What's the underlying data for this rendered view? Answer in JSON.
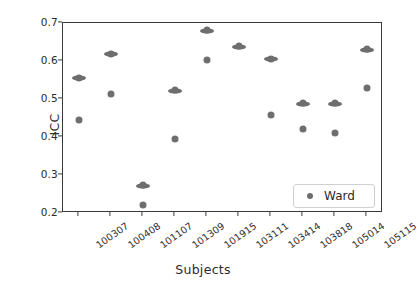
{
  "chart_data": {
    "type": "scatter",
    "title": "",
    "xlabel": "Subjects",
    "ylabel": "ICC",
    "categories": [
      "100307",
      "100408",
      "101107",
      "101309",
      "101915",
      "103111",
      "103414",
      "103818",
      "105014",
      "105115"
    ],
    "yticks": [
      0.2,
      0.3,
      0.4,
      0.5,
      0.6,
      0.7
    ],
    "ytick_labels": [
      "0.2",
      "0.3",
      "0.4",
      "0.5",
      "0.6",
      "0.7"
    ],
    "ylim": [
      0.2,
      0.7
    ],
    "grid": false,
    "legend_position": "lower right",
    "series": [
      {
        "name": "Ward",
        "marker": "bar",
        "color": "#6e6e6e",
        "values": [
          0.555,
          0.618,
          0.272,
          0.522,
          0.68,
          0.637,
          0.605,
          0.487,
          0.487,
          0.63
        ]
      },
      {
        "name": "Ward",
        "marker": "dot",
        "color": "#6e6e6e",
        "values": [
          0.445,
          0.513,
          0.222,
          0.395,
          0.603,
          null,
          0.457,
          0.42,
          0.41,
          0.528
        ]
      }
    ]
  },
  "legend": {
    "entries": [
      {
        "label": "Ward",
        "color": "#6e6e6e",
        "marker": "dot"
      }
    ]
  },
  "axes": {
    "x_axis_label": "Subjects",
    "y_axis_label": "ICC"
  }
}
